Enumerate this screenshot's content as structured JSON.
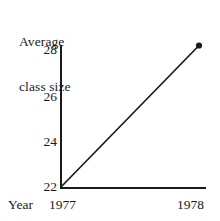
{
  "chart_data": {
    "type": "line",
    "title": "Average class size",
    "title_lines": [
      "Average",
      "class size"
    ],
    "xlabel": "Year",
    "ylabel": "Average class size",
    "x": [
      "1977",
      "1978"
    ],
    "values": [
      22,
      28
    ],
    "series": [
      {
        "name": "Average class size",
        "x": [
          "1977",
          "1978"
        ],
        "values": [
          22,
          28
        ]
      }
    ],
    "xtick_labels": [
      "1977",
      "1978"
    ],
    "ytick_labels": [
      "28",
      "26",
      "24",
      "22"
    ],
    "ytick_values": [
      28,
      26,
      24,
      22
    ],
    "ylim": [
      22,
      28
    ],
    "grid": false,
    "legend": false,
    "markers": [
      "none",
      "filled-circle"
    ],
    "line_color": "#1a1a1a",
    "axis_color": "#1a1a1a",
    "background_color": "#ffffff",
    "annotations": []
  },
  "axis": {
    "y_label_text": "Average class size",
    "x_name": "Year"
  }
}
